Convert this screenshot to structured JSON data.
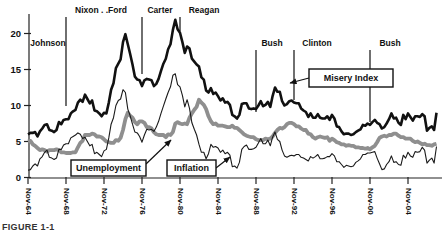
{
  "figure": {
    "caption": "FIGURE 1-1"
  },
  "colors": {
    "background": "#ffffff",
    "misery_line": "#111111",
    "unemployment_line": "#8f8f8f",
    "inflation_line": "#1a1a1a",
    "axis": "#222222",
    "annotation_box_fill": "#ffffff",
    "annotation_box_border": "#111111",
    "text": "#111111"
  },
  "chart_data": {
    "type": "line",
    "title": "",
    "xlabel": "",
    "ylabel": "",
    "x_start": "Nov-1964",
    "x_points_per_year": 4,
    "x_tick_labels": [
      "Nov-64",
      "Nov-68",
      "Nov-72",
      "Nov-76",
      "Nov-80",
      "Nov-84",
      "Nov-88",
      "Nov-92",
      "Nov-96",
      "Nov-00",
      "Nov-04"
    ],
    "x_tick_year_offsets": [
      0,
      4,
      8,
      12,
      16,
      20,
      24,
      28,
      32,
      36,
      40
    ],
    "y_ticks": [
      0,
      5,
      10,
      15,
      20
    ],
    "ylim": [
      0,
      22.5
    ],
    "grid": false,
    "legend_position": "in-plot callout boxes",
    "series": [
      {
        "name": "Unemployment",
        "style": "thick-gray",
        "values": [
          5.0,
          5.1,
          4.6,
          4.4,
          4.1,
          3.8,
          3.9,
          3.8,
          3.6,
          3.8,
          3.8,
          3.8,
          3.9,
          3.8,
          3.5,
          3.5,
          3.4,
          3.4,
          3.4,
          3.5,
          3.5,
          4.2,
          4.8,
          5.1,
          5.9,
          5.9,
          5.9,
          6.1,
          6.0,
          5.7,
          5.7,
          5.6,
          5.3,
          5.0,
          4.9,
          4.8,
          4.8,
          5.2,
          5.1,
          5.5,
          6.6,
          8.1,
          9.0,
          8.6,
          8.3,
          7.7,
          7.4,
          7.8,
          7.8,
          7.6,
          7.0,
          7.0,
          6.8,
          6.3,
          6.0,
          5.9,
          5.9,
          5.9,
          5.6,
          6.0,
          5.9,
          6.3,
          7.5,
          7.7,
          7.5,
          7.4,
          7.5,
          7.4,
          8.3,
          8.9,
          9.4,
          9.8,
          10.8,
          10.4,
          10.1,
          9.5,
          8.5,
          7.8,
          7.4,
          7.5,
          7.2,
          7.2,
          7.2,
          7.1,
          7.0,
          7.0,
          7.2,
          6.9,
          6.9,
          6.6,
          6.3,
          6.0,
          5.8,
          5.7,
          5.6,
          5.6,
          5.3,
          5.2,
          5.2,
          5.2,
          5.4,
          5.3,
          5.4,
          5.7,
          6.2,
          6.6,
          6.9,
          6.8,
          7.0,
          7.4,
          7.6,
          7.6,
          7.4,
          7.1,
          7.1,
          6.8,
          6.6,
          6.6,
          6.1,
          6.0,
          5.6,
          5.4,
          5.6,
          5.7,
          5.6,
          5.5,
          5.6,
          5.1,
          5.4,
          5.2,
          4.9,
          4.8,
          4.6,
          4.6,
          4.4,
          4.5,
          4.4,
          4.4,
          4.2,
          4.2,
          4.1,
          4.1,
          4.0,
          4.1,
          3.9,
          4.2,
          4.4,
          4.9,
          5.5,
          5.7,
          5.8,
          5.7,
          5.9,
          5.9,
          6.1,
          6.1,
          5.8,
          5.6,
          5.6,
          5.4,
          5.4,
          5.4,
          5.1,
          4.9,
          5.0,
          4.8,
          4.6,
          4.7,
          4.5,
          4.5,
          4.4,
          4.6,
          4.7
        ]
      },
      {
        "name": "Inflation",
        "style": "thin-black",
        "values": [
          1.0,
          1.1,
          1.6,
          1.9,
          1.6,
          2.6,
          2.9,
          3.5,
          3.8,
          2.8,
          2.7,
          2.5,
          2.7,
          3.9,
          3.9,
          4.5,
          4.7,
          4.7,
          5.5,
          5.7,
          5.9,
          6.2,
          6.0,
          5.4,
          5.6,
          5.0,
          4.4,
          4.6,
          3.3,
          3.5,
          3.2,
          2.9,
          3.7,
          3.9,
          5.5,
          7.4,
          8.3,
          10.0,
          10.7,
          10.9,
          12.2,
          11.8,
          9.5,
          8.6,
          7.4,
          6.3,
          6.2,
          5.7,
          4.9,
          5.9,
          6.7,
          6.6,
          6.7,
          6.4,
          7.0,
          7.8,
          8.9,
          9.9,
          10.9,
          11.8,
          12.6,
          14.2,
          14.4,
          12.9,
          12.6,
          11.4,
          9.8,
          10.8,
          9.6,
          7.6,
          6.7,
          5.9,
          4.6,
          3.5,
          3.5,
          2.6,
          3.3,
          4.6,
          4.2,
          4.3,
          4.1,
          3.5,
          3.8,
          3.3,
          3.5,
          3.1,
          1.5,
          1.6,
          1.3,
          2.1,
          3.9,
          4.3,
          4.5,
          3.9,
          3.9,
          4.0,
          4.2,
          4.8,
          5.4,
          4.7,
          4.7,
          5.2,
          4.4,
          5.6,
          6.3,
          5.3,
          5.0,
          3.8,
          3.0,
          2.8,
          3.0,
          3.1,
          3.0,
          3.2,
          3.2,
          2.8,
          2.7,
          2.5,
          2.3,
          2.9,
          2.7,
          2.9,
          3.2,
          2.6,
          2.6,
          2.7,
          2.9,
          2.9,
          3.3,
          3.0,
          2.2,
          2.2,
          1.8,
          1.4,
          1.7,
          1.6,
          1.5,
          1.6,
          2.1,
          2.3,
          2.6,
          3.2,
          3.2,
          3.4,
          3.4,
          3.5,
          3.6,
          2.7,
          1.9,
          1.1,
          1.2,
          1.8,
          2.2,
          3.0,
          2.1,
          2.2,
          1.8,
          1.7,
          3.1,
          2.7,
          3.5,
          3.0,
          2.8,
          3.6,
          3.5,
          3.6,
          4.2,
          3.8,
          2.0,
          2.4,
          2.7,
          2.0,
          4.3
        ]
      },
      {
        "name": "Misery Index",
        "style": "thick-black",
        "derived": "sum of Unemployment + Inflation"
      }
    ],
    "presidents": [
      {
        "name": "Johnson",
        "label_x": 48,
        "label_row": "mid",
        "line_year": null,
        "line_y1": null,
        "line_y2": null
      },
      {
        "name": "Nixon . .Ford",
        "label_x": 101,
        "label_row": "top",
        "line_year": 4,
        "line_y1": 17,
        "line_y2": 106
      },
      {
        "name": "Carter",
        "label_x": 160,
        "label_row": "top",
        "line_year": 12,
        "line_y1": 17,
        "line_y2": 74
      },
      {
        "name": "Reagan",
        "label_x": 204,
        "label_row": "top",
        "line_year": 16,
        "line_y1": 17,
        "line_y2": 31
      },
      {
        "name": "Bush",
        "label_x": 272,
        "label_row": "mid",
        "line_year": 24,
        "line_y1": 50,
        "line_y2": 112
      },
      {
        "name": "Clinton",
        "label_x": 317,
        "label_row": "mid",
        "line_year": 28,
        "line_y1": 50,
        "line_y2": 100
      },
      {
        "name": "Bush",
        "label_x": 390,
        "label_row": "mid",
        "line_year": 36,
        "line_y1": 50,
        "line_y2": 122
      }
    ],
    "annotations": [
      {
        "text": "Misery Index",
        "box_x": 309,
        "box_y": 69,
        "box_w": 84,
        "box_h": 18,
        "ax1": 309,
        "ay1": 78,
        "ax2": 290,
        "ay2": 83
      },
      {
        "text": "Unemployment",
        "box_x": 71,
        "box_y": 160,
        "box_w": 75,
        "box_h": 16,
        "ax1": 146,
        "ay1": 164,
        "ax2": 171,
        "ay2": 140
      },
      {
        "text": "Inflation",
        "box_x": 167,
        "box_y": 160,
        "box_w": 49,
        "box_h": 16,
        "ax1": 216,
        "ay1": 168,
        "ax2": 230,
        "ay2": 157
      }
    ]
  }
}
